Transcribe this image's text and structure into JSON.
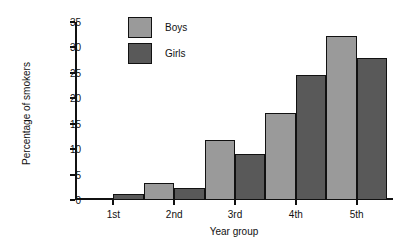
{
  "chart_data": {
    "type": "bar",
    "title": "",
    "subtitle": "",
    "xlabel": "Year group",
    "ylabel": "Percentage of smokers",
    "categories": [
      "1st",
      "2nd",
      "3rd",
      "4th",
      "5th"
    ],
    "series": [
      {
        "name": "Boys",
        "values": [
          0.2,
          3.4,
          11.8,
          17.2,
          32.3
        ],
        "color": "#9a9a9a"
      },
      {
        "name": "Girls",
        "values": [
          1.2,
          2.3,
          9.0,
          24.6,
          28.0
        ],
        "color": "#595959"
      }
    ],
    "ylim": [
      0,
      35
    ],
    "yticks": [
      0,
      5,
      10,
      15,
      20,
      25,
      30,
      35
    ],
    "ytick_labels": [
      "0",
      "5",
      "10",
      "15",
      "20",
      "25",
      "30",
      "35"
    ],
    "grid": false,
    "legend_position": "top-center",
    "bar_style": "adjacent-touching",
    "edge_color": "#111111",
    "background": "#ffffff"
  }
}
